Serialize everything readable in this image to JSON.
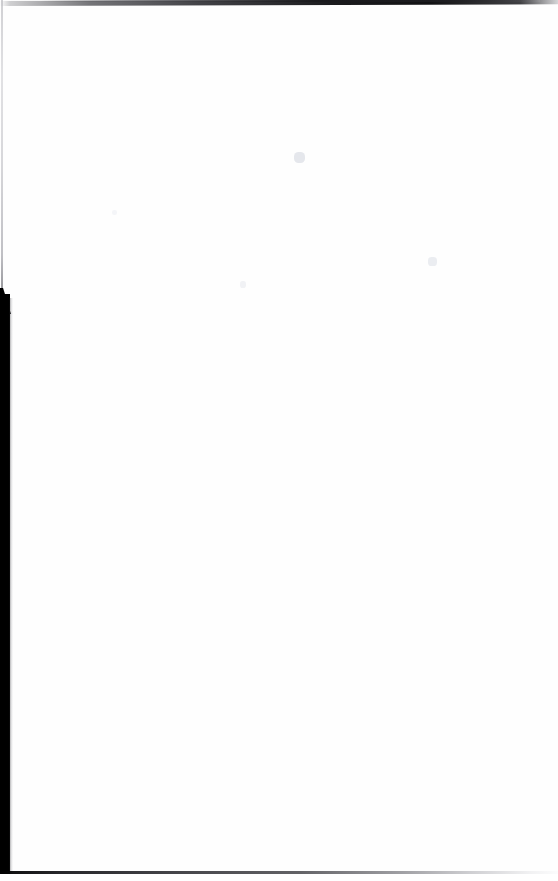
{
  "page": {
    "kind": "scanned-blank-page",
    "width": 558,
    "height": 881,
    "background_color": "#ffffff",
    "paper_color": "#fefefe",
    "visible_text": "",
    "text_content_note": ""
  },
  "artifacts": {
    "top_edge": {
      "name": "top-scan-edge",
      "color": "#0a0a0c",
      "position": "top",
      "y": 1,
      "thickness": 5,
      "note": "slanted dark line, strongest toward the right"
    },
    "left_hairline": {
      "name": "left-edge-hairline",
      "color": "#aaaab0",
      "position": "left",
      "x": 1,
      "from_y": 0,
      "to_y": 300,
      "thickness": 2
    },
    "left_band": {
      "name": "left-gutter-band",
      "color": "#000000",
      "position": "left",
      "x": 0,
      "from_y": 294,
      "to_y": 874,
      "width": 10,
      "note": "solid black binding shadow with a diagonal taper at its top"
    },
    "bottom_edge": {
      "name": "bottom-scan-edge",
      "color": "#000000",
      "position": "bottom",
      "y": 871,
      "thickness": 3,
      "note": "dark line fading toward the right"
    },
    "speckles": [
      {
        "name": "speckle-a",
        "x": 294,
        "y": 152,
        "color": "#e1e3e9"
      },
      {
        "name": "speckle-b",
        "x": 428,
        "y": 257,
        "color": "#e6e8ee"
      },
      {
        "name": "speckle-c",
        "x": 240,
        "y": 281,
        "color": "#eceef2"
      },
      {
        "name": "speckle-d",
        "x": 112,
        "y": 210,
        "color": "#f0f1f5"
      }
    ]
  }
}
